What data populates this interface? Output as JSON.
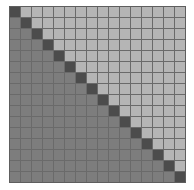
{
  "matrix": {
    "rows": 16,
    "cols": 16,
    "colors": {
      "upper": "#b5b5b5",
      "lower": "#7d7d7d",
      "diagonal": "#4c4c4c",
      "gridline": "#6a6a6a"
    },
    "description": "16x16 grid; dark cells on the main diagonal, light cells above, medium gray cells below"
  }
}
